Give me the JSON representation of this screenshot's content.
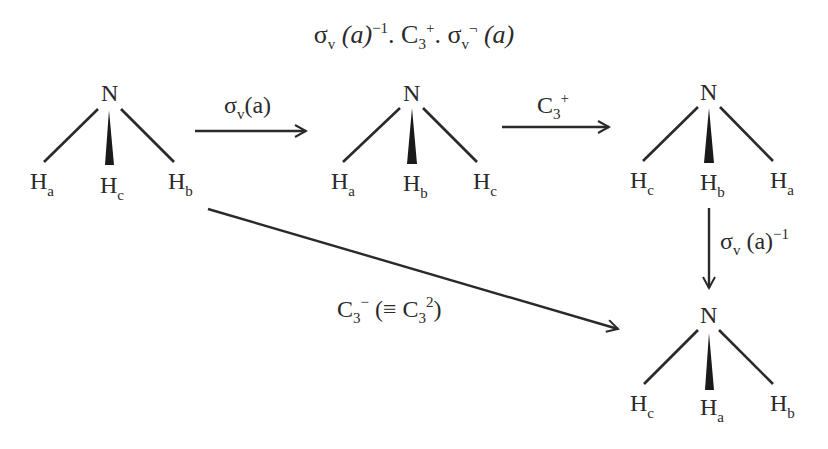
{
  "title": {
    "sigma": "σ",
    "v": "v",
    "a_paren": "(a)",
    "inv": "−1",
    "dot1": ". C",
    "three": "3",
    "plus": "+",
    "dot2": ". σ",
    "v2": "v",
    "minus": "¬",
    "a_paren2": " (a)"
  },
  "molecules": [
    {
      "n": "N",
      "left": {
        "h": "H",
        "s": "a"
      },
      "center": {
        "h": "H",
        "s": "c"
      },
      "right": {
        "h": "H",
        "s": "b"
      }
    },
    {
      "n": "N",
      "left": {
        "h": "H",
        "s": "a"
      },
      "center": {
        "h": "H",
        "s": "b"
      },
      "right": {
        "h": "H",
        "s": "c"
      }
    },
    {
      "n": "N",
      "left": {
        "h": "H",
        "s": "c"
      },
      "center": {
        "h": "H",
        "s": "b"
      },
      "right": {
        "h": "H",
        "s": "a"
      }
    },
    {
      "n": "N",
      "left": {
        "h": "H",
        "s": "c"
      },
      "center": {
        "h": "H",
        "s": "a"
      },
      "right": {
        "h": "H",
        "s": "b"
      }
    }
  ],
  "arrows": {
    "sigma_v_a": {
      "sym": "σ",
      "sub": "v",
      "rest": "(a)"
    },
    "c3_plus": {
      "sym": "C",
      "sub": "3",
      "sup": "+"
    },
    "sigma_v_a_inv": {
      "sym": "σ",
      "sub": "v",
      "rest": " (a)",
      "sup": "−1"
    },
    "c3_minus": {
      "sym": "C",
      "sub": "3",
      "sup": "−",
      "mid": " (≡ C",
      "sub2": "3",
      "sup2": "2",
      "end": ")"
    }
  }
}
